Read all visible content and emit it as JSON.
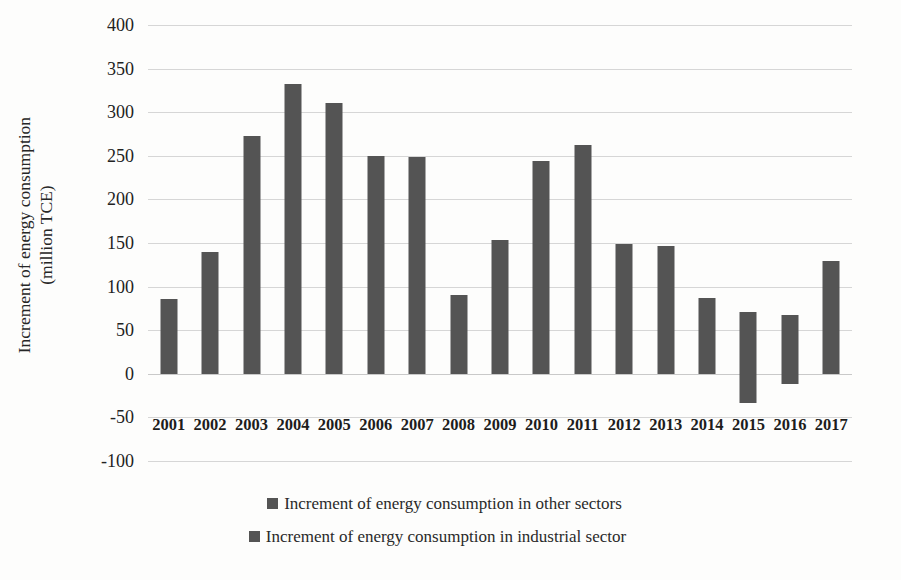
{
  "chart_data": {
    "type": "bar",
    "title": "",
    "subtitle": "",
    "xlabel": "",
    "ylabel": "Increment of energy consumption (million TCE)",
    "ylabel_lines": [
      "Increment of energy consumption",
      "(million TCE)"
    ],
    "ylim": [
      -100,
      400
    ],
    "ytick_values": [
      400,
      350,
      300,
      250,
      200,
      150,
      100,
      50,
      0,
      -50,
      -100
    ],
    "ytick_labels": [
      "400",
      "350",
      "300",
      "250",
      "200",
      "150",
      "100",
      "50",
      "0",
      "-50",
      "-100"
    ],
    "grid": true,
    "grid_axis": "y",
    "legend_position": "bottom",
    "stacked": true,
    "categories": [
      "2001",
      "2002",
      "2003",
      "2004",
      "2005",
      "2006",
      "2007",
      "2008",
      "2009",
      "2010",
      "2011",
      "2012",
      "2013",
      "2014",
      "2015",
      "2016",
      "2017"
    ],
    "series": [
      {
        "name": "Increment of energy consumption in other sectors",
        "color": "#545454",
        "values": [
          86,
          140,
          273,
          332,
          310,
          250,
          249,
          90,
          154,
          244,
          262,
          149,
          146,
          87,
          71,
          67,
          129
        ]
      },
      {
        "name": "Increment of energy consumption in industrial sector",
        "color": "#545454",
        "values": [
          0,
          0,
          0,
          0,
          0,
          0,
          0,
          0,
          0,
          0,
          0,
          0,
          0,
          0,
          -33,
          -12,
          0
        ]
      }
    ],
    "annotations": []
  },
  "legend": {
    "entries": [
      {
        "label": "Increment of energy consumption in other sectors",
        "color": "#545454"
      },
      {
        "label": "Increment of energy consumption in industrial sector",
        "color": "#545454"
      }
    ]
  }
}
